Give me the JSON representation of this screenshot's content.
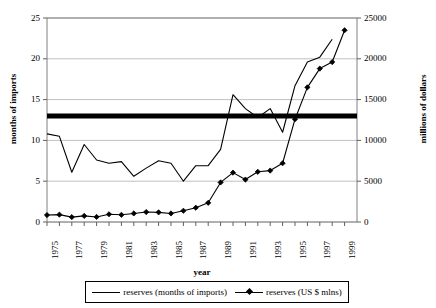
{
  "chart_data": {
    "type": "line",
    "title": "",
    "xlabel": "year",
    "ylabel": "months of imports",
    "ylabel_secondary": "millions of dollars",
    "grid": true,
    "legend_position": "bottom",
    "x": [
      1975,
      1976,
      1977,
      1978,
      1979,
      1980,
      1981,
      1982,
      1983,
      1984,
      1985,
      1986,
      1987,
      1988,
      1989,
      1990,
      1991,
      1992,
      1993,
      1994,
      1995,
      1996,
      1997,
      1998,
      1999
    ],
    "xtick_labels": [
      "1975",
      "1977",
      "1979",
      "1981",
      "1983",
      "1985",
      "1987",
      "1989",
      "1991",
      "1993",
      "1995",
      "1997",
      "1999"
    ],
    "xlim": [
      1975,
      2000
    ],
    "ylim": [
      0,
      25
    ],
    "ytick_labels": [
      "0",
      "5",
      "10",
      "15",
      "20",
      "25"
    ],
    "ytick_values": [
      0,
      5,
      10,
      15,
      20,
      25
    ],
    "ylim_secondary": [
      0,
      25000
    ],
    "ytick_labels_secondary": [
      "0",
      "5000",
      "10000",
      "15000",
      "20000",
      "25000"
    ],
    "ytick_values_secondary": [
      0,
      5000,
      10000,
      15000,
      20000,
      25000
    ],
    "series": [
      {
        "name": "reserves (months of imports)",
        "axis": "left",
        "marker": "none",
        "color": "#000000",
        "values": [
          10.8,
          10.5,
          6.1,
          9.5,
          7.6,
          7.2,
          7.4,
          5.6,
          6.6,
          7.5,
          7.2,
          5.0,
          6.9,
          6.9,
          8.9,
          15.6,
          13.9,
          12.8,
          13.9,
          11.0,
          16.7,
          19.6,
          20.2,
          22.4,
          null
        ]
      },
      {
        "name": "reserves (US $ mlns)",
        "axis": "right",
        "marker": "diamond",
        "color": "#000000",
        "values": [
          850,
          900,
          600,
          750,
          620,
          950,
          880,
          1050,
          1220,
          1180,
          1050,
          1380,
          1750,
          2350,
          4850,
          6050,
          5200,
          6150,
          6300,
          7200,
          12600,
          16500,
          18800,
          19600,
          23500
        ]
      }
    ],
    "reference_line": {
      "name": "threshold",
      "axis": "left",
      "value": 13.0,
      "color": "#000000",
      "width": 5
    }
  },
  "legend": {
    "items": [
      {
        "label": "reserves (months of imports)",
        "marker": "line"
      },
      {
        "label": "reserves (US $ mlns)",
        "marker": "line-diamond"
      }
    ]
  }
}
